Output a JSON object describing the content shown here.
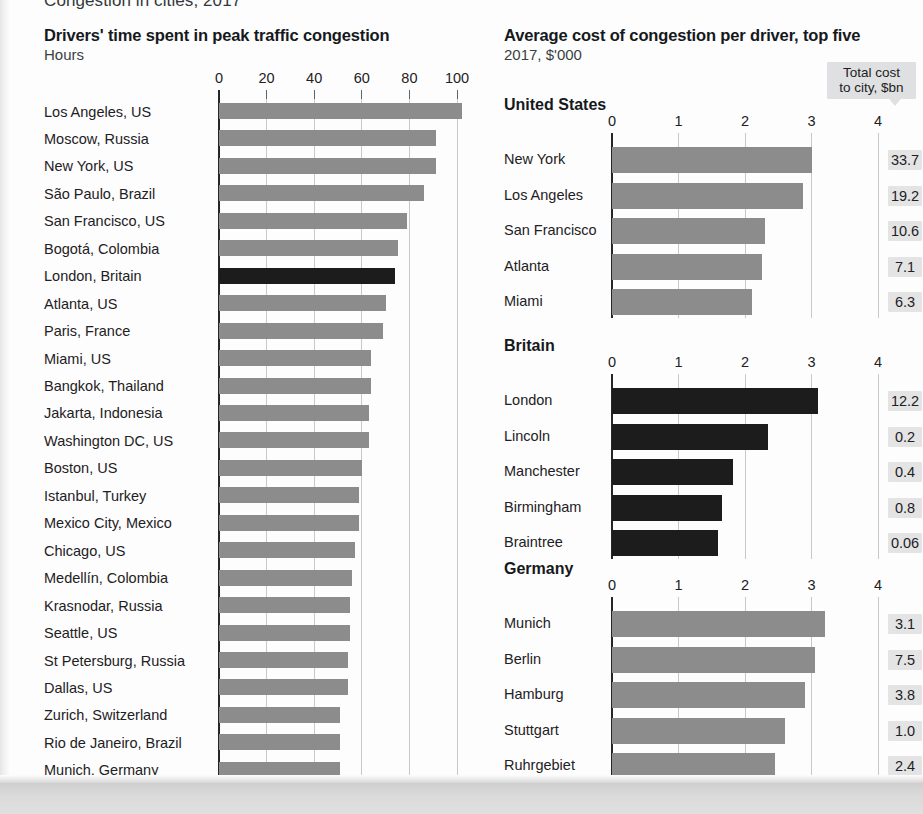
{
  "kicker": "Congestion in cities, 2017",
  "colors": {
    "bar_grey": "#8c8c8c",
    "bar_dark": "#1c1c1c",
    "value_box": "#e4e4e5",
    "callout_box": "#dfe0e1",
    "gridline": "#c6c9cb",
    "axis": "#23272a",
    "page": "#fdfdfd"
  },
  "chart_data": [
    {
      "type": "bar",
      "orientation": "horizontal",
      "title": "Drivers' time spent in peak traffic congestion",
      "subtitle": "Hours",
      "ylabel": "",
      "xlabel": "Hours",
      "xlim": [
        0,
        100
      ],
      "xticks": [
        "0",
        "20",
        "40",
        "60",
        "80",
        "100"
      ],
      "xtick_values": [
        0,
        20,
        40,
        60,
        80,
        100
      ],
      "grid": true,
      "legend": "none",
      "highlight_category": "London, Britain",
      "categories": [
        "Los Angeles, US",
        "Moscow, Russia",
        "New York, US",
        "São Paulo, Brazil",
        "San Francisco, US",
        "Bogotá, Colombia",
        "London, Britain",
        "Atlanta, US",
        "Paris, France",
        "Miami, US",
        "Bangkok, Thailand",
        "Jakarta, Indonesia",
        "Washington DC, US",
        "Boston, US",
        "Istanbul, Turkey",
        "Mexico City, Mexico",
        "Chicago, US",
        "Medellín, Colombia",
        "Krasnodar, Russia",
        "Seattle, US",
        "St Petersburg, Russia",
        "Dallas, US",
        "Zurich, Switzerland",
        "Rio de Janeiro, Brazil",
        "Munich, Germany"
      ],
      "values": [
        102,
        91,
        91,
        86,
        79,
        75,
        74,
        70,
        69,
        64,
        64,
        63,
        63,
        60,
        59,
        59,
        57,
        56,
        55,
        55,
        54,
        54,
        51,
        51,
        51
      ],
      "dark_bars": [
        "London, Britain"
      ]
    },
    {
      "type": "bar",
      "orientation": "horizontal",
      "title": "Average cost of congestion per driver, top five",
      "subtitle": "2017, $'000",
      "annotation": {
        "line1": "Total cost",
        "line2": "to city, $bn"
      },
      "xlim": [
        0,
        4
      ],
      "xticks": [
        "0",
        "1",
        "2",
        "3",
        "4"
      ],
      "xtick_values": [
        0,
        1,
        2,
        3,
        4
      ],
      "grid": true,
      "groups": [
        {
          "name": "United States",
          "shade": "grey",
          "categories": [
            "New York",
            "Los Angeles",
            "San Francisco",
            "Atlanta",
            "Miami"
          ],
          "values": [
            3.0,
            2.87,
            2.3,
            2.25,
            2.1
          ],
          "total_cost_label": [
            "33.7",
            "19.2",
            "10.6",
            "7.1",
            "6.3"
          ]
        },
        {
          "name": "Britain",
          "shade": "dark",
          "categories": [
            "London",
            "Lincoln",
            "Manchester",
            "Birmingham",
            "Braintree"
          ],
          "values": [
            3.1,
            2.35,
            1.82,
            1.66,
            1.6
          ],
          "total_cost_label": [
            "12.2",
            "0.2",
            "0.4",
            "0.8",
            "0.06"
          ]
        },
        {
          "name": "Germany",
          "shade": "grey",
          "categories": [
            "Munich",
            "Berlin",
            "Hamburg",
            "Stuttgart",
            "Ruhrgebiet"
          ],
          "values": [
            3.2,
            3.05,
            2.9,
            2.6,
            2.45
          ],
          "total_cost_label": [
            "3.1",
            "7.5",
            "3.8",
            "1.0",
            "2.4"
          ]
        }
      ]
    }
  ]
}
